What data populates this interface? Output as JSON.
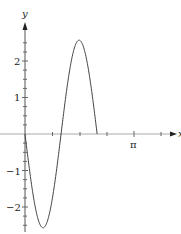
{
  "chart_data": {
    "type": "line",
    "title": "",
    "xlabel": "x",
    "ylabel": "y",
    "xlim": [
      0,
      3.93
    ],
    "ylim": [
      -2.7,
      3.0
    ],
    "grid": false,
    "legend": null,
    "x_ticks": {
      "labeled": [
        {
          "value": 3.14159,
          "label": "π"
        }
      ],
      "minor_step": 0.785398
    },
    "y_ticks": {
      "labeled": [
        {
          "value": 2,
          "label": "2"
        },
        {
          "value": 1,
          "label": "1"
        },
        {
          "value": -1,
          "label": "−1"
        },
        {
          "value": -2,
          "label": "−2"
        }
      ],
      "minor_step": 0.25
    },
    "series": [
      {
        "name": "curve",
        "description": "y = -2.57·sin(3x) on [0, 2π/3]",
        "x": [
          0,
          0.1745,
          0.3491,
          0.5236,
          0.6981,
          0.8727,
          1.0472,
          1.2217,
          1.3963,
          1.5708,
          1.7453,
          1.9199,
          2.0944
        ],
        "y": [
          0,
          -1.285,
          -2.226,
          -2.57,
          -2.226,
          -1.285,
          0,
          1.285,
          2.226,
          2.57,
          2.226,
          1.285,
          0
        ]
      }
    ],
    "color": "#444444"
  },
  "axes": {
    "x_label": "x",
    "y_label": "y",
    "pi_label": "π",
    "y_labels": [
      "2",
      "1",
      "−1",
      "−2"
    ]
  }
}
